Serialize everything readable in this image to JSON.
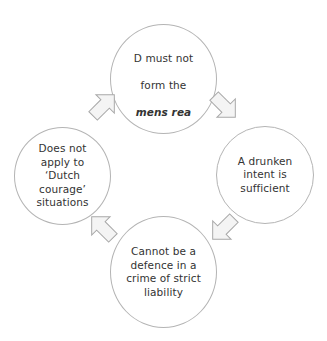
{
  "diagram": {
    "type": "cycle",
    "direction": "clockwise",
    "colors": {
      "circle_border": "#b4b4b4",
      "arrow_fill": "#f4f4f4",
      "arrow_stroke": "#a8a8a8",
      "text": "#333333",
      "background": "#ffffff"
    },
    "nodes": [
      {
        "id": "top",
        "line1": "D must not",
        "line2": "form the",
        "line3_italic_bold": "mens rea"
      },
      {
        "id": "right",
        "text": "A drunken\nintent is\nsufficient"
      },
      {
        "id": "bottom",
        "text": "Cannot be a\ndefence in a\ncrime of strict\nliability"
      },
      {
        "id": "left",
        "text": "Does not\napply to\n‘Dutch\ncourage’\nsituations"
      }
    ],
    "arrows": [
      {
        "from": "top",
        "to": "right",
        "icon": "arrow-down-right-icon"
      },
      {
        "from": "right",
        "to": "bottom",
        "icon": "arrow-down-left-icon"
      },
      {
        "from": "bottom",
        "to": "left",
        "icon": "arrow-up-left-icon"
      },
      {
        "from": "left",
        "to": "top",
        "icon": "arrow-up-right-icon"
      }
    ]
  }
}
